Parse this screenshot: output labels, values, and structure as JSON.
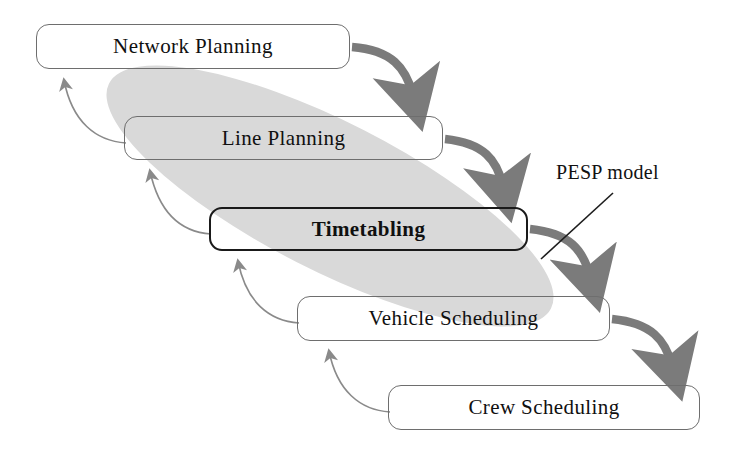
{
  "diagram": {
    "background_color": "#ffffff",
    "nodes": [
      {
        "id": "network-planning",
        "label": "Network Planning",
        "x": 36,
        "y": 24,
        "w": 314,
        "h": 45,
        "style": "normal"
      },
      {
        "id": "line-planning",
        "label": "Line Planning",
        "x": 124,
        "y": 116,
        "w": 319,
        "h": 44,
        "style": "normal"
      },
      {
        "id": "timetabling",
        "label": "Timetabling",
        "x": 209,
        "y": 207,
        "w": 319,
        "h": 44,
        "style": "highlight"
      },
      {
        "id": "vehicle-scheduling",
        "label": "Vehicle Scheduling",
        "x": 297,
        "y": 296,
        "w": 313,
        "h": 45,
        "style": "normal"
      },
      {
        "id": "crew-scheduling",
        "label": "Crew Scheduling",
        "x": 388,
        "y": 385,
        "w": 312,
        "h": 45,
        "style": "normal"
      }
    ],
    "annotation": {
      "id": "pesp-model",
      "label": "PESP model",
      "x": 556,
      "y": 161,
      "leader_from": [
        613,
        193
      ],
      "leader_to": [
        541,
        259
      ]
    },
    "highlight_blob": {
      "id": "pesp-scope-blob",
      "fill_color": "#d9d9d9",
      "description": "diagonal gray oval covering Line Planning, Timetabling and Vehicle Scheduling"
    },
    "forward_arrows": {
      "color": "#7b7b7b",
      "description": "thick gray curved arrows flowing down-right from each stage to the next",
      "edges": [
        {
          "from": "network-planning",
          "to": "line-planning"
        },
        {
          "from": "line-planning",
          "to": "timetabling"
        },
        {
          "from": "timetabling",
          "to": "vehicle-scheduling"
        },
        {
          "from": "vehicle-scheduling",
          "to": "crew-scheduling"
        }
      ]
    },
    "feedback_arrows": {
      "color": "#8a8a8a",
      "description": "thin gray curved feedback arrows pointing back up-left to the previous stage",
      "edges": [
        {
          "from": "line-planning",
          "to": "network-planning"
        },
        {
          "from": "timetabling",
          "to": "line-planning"
        },
        {
          "from": "vehicle-scheduling",
          "to": "timetabling"
        },
        {
          "from": "crew-scheduling",
          "to": "vehicle-scheduling"
        }
      ]
    }
  }
}
